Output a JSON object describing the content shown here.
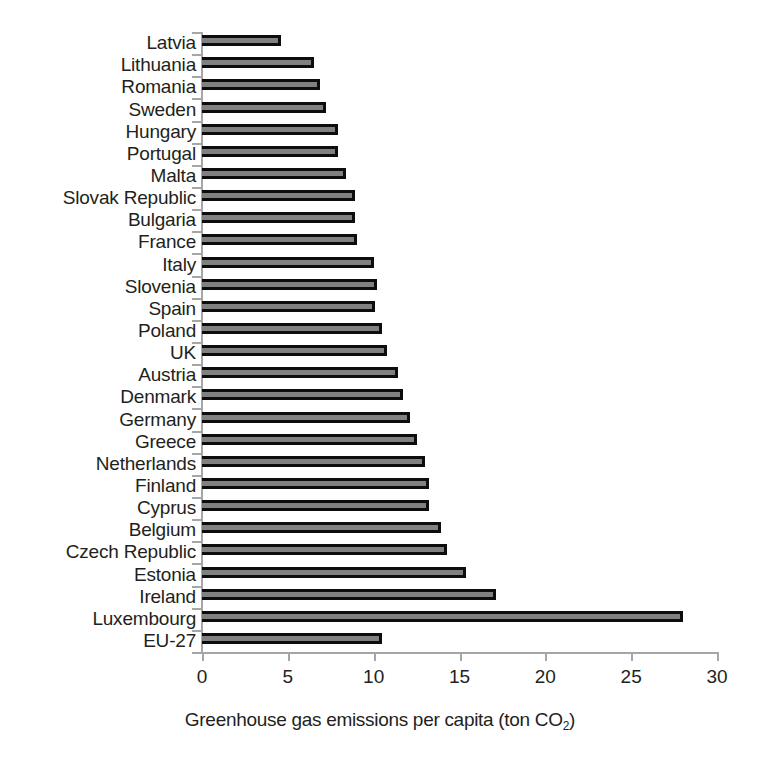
{
  "chart_data": {
    "type": "bar",
    "orientation": "horizontal",
    "title": "",
    "xlabel": "Greenhouse gas emissions per capita (ton CO2)",
    "ylabel": "",
    "xlim": [
      0,
      30
    ],
    "xticks": [
      0,
      5,
      10,
      15,
      20,
      25,
      30
    ],
    "xtick_labels": [
      "0",
      "5",
      "10",
      "15",
      "20",
      "25",
      "30"
    ],
    "grid": false,
    "legend": false,
    "categories": [
      "Latvia",
      "Lithuania",
      "Romania",
      "Sweden",
      "Hungary",
      "Portugal",
      "Malta",
      "Slovak Republic",
      "Bulgaria",
      "France",
      "Italy",
      "Slovenia",
      "Spain",
      "Poland",
      "UK",
      "Austria",
      "Denmark",
      "Germany",
      "Greece",
      "Netherlands",
      "Finland",
      "Cyprus",
      "Belgium",
      "Czech Republic",
      "Estonia",
      "Ireland",
      "Luxembourg",
      "EU-27"
    ],
    "values": [
      4.6,
      6.5,
      6.9,
      7.2,
      7.9,
      7.9,
      8.4,
      8.9,
      8.9,
      9.0,
      10.0,
      10.2,
      10.1,
      10.5,
      10.8,
      11.4,
      11.7,
      12.1,
      12.5,
      13.0,
      13.2,
      13.2,
      13.9,
      14.3,
      15.4,
      17.1,
      28.0,
      10.5
    ],
    "bar_fill_color": "#808080",
    "bar_edge_color": "#0d0d0d",
    "axis_color": "#a6a6a6",
    "text_color": "#231f20",
    "background_color": "#ffffff"
  },
  "axis_title_parts": {
    "main": "Greenhouse gas emissions per capita (ton CO",
    "sub": "2",
    "tail": ")"
  }
}
